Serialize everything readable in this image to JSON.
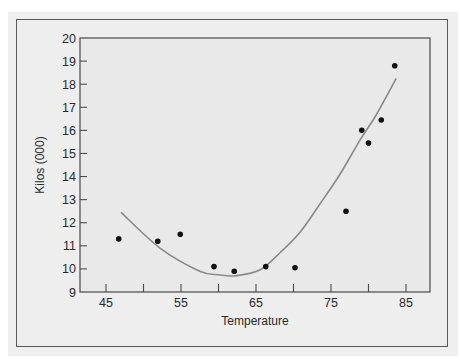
{
  "chart_data": {
    "type": "scatter",
    "title": "",
    "xlabel": "Temperature",
    "ylabel": "Kilos (000)",
    "xlim": [
      41.5,
      88
    ],
    "ylim": [
      9,
      20
    ],
    "x_ticks": [
      45,
      50,
      55,
      60,
      65,
      70,
      75,
      80,
      85
    ],
    "x_tick_labels": [
      "45",
      "",
      "55",
      "",
      "65",
      "",
      "75",
      "",
      "85"
    ],
    "y_ticks": [
      9,
      10,
      11,
      12,
      13,
      14,
      15,
      16,
      17,
      18,
      19,
      20
    ],
    "y_tick_labels": [
      "9",
      "10",
      "11",
      "12",
      "13",
      "14",
      "15",
      "16",
      "17",
      "18",
      "19",
      "20"
    ],
    "grid": false,
    "legend": null,
    "series": [
      {
        "name": "Observed",
        "kind": "scatter",
        "color": "#111111",
        "points": [
          {
            "x": 46.7,
            "y": 11.3
          },
          {
            "x": 51.9,
            "y": 11.2
          },
          {
            "x": 54.9,
            "y": 11.5
          },
          {
            "x": 59.4,
            "y": 10.1
          },
          {
            "x": 62.1,
            "y": 9.9
          },
          {
            "x": 66.3,
            "y": 10.1
          },
          {
            "x": 70.2,
            "y": 10.05
          },
          {
            "x": 77.0,
            "y": 12.5
          },
          {
            "x": 79.1,
            "y": 16.0
          },
          {
            "x": 80.0,
            "y": 15.45
          },
          {
            "x": 81.7,
            "y": 16.45
          },
          {
            "x": 83.5,
            "y": 18.8
          }
        ]
      },
      {
        "name": "Quadratic fit",
        "kind": "line",
        "color": "#8a8a8a",
        "points": [
          {
            "x": 47.0,
            "y": 12.45
          },
          {
            "x": 52.2,
            "y": 10.9
          },
          {
            "x": 57.5,
            "y": 9.9
          },
          {
            "x": 60.0,
            "y": 9.75
          },
          {
            "x": 62.2,
            "y": 9.7
          },
          {
            "x": 65.5,
            "y": 9.95
          },
          {
            "x": 68.2,
            "y": 10.7
          },
          {
            "x": 70.9,
            "y": 11.6
          },
          {
            "x": 73.5,
            "y": 12.8
          },
          {
            "x": 76.2,
            "y": 14.1
          },
          {
            "x": 78.9,
            "y": 15.6
          },
          {
            "x": 80.9,
            "y": 16.6
          },
          {
            "x": 83.7,
            "y": 18.25
          }
        ]
      }
    ]
  }
}
